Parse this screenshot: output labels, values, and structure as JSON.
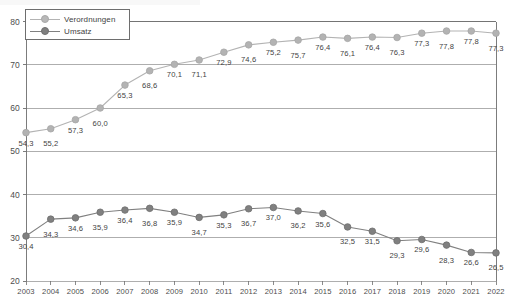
{
  "chart_data": {
    "type": "line",
    "title": "",
    "xlabel": "",
    "ylabel": "",
    "categories": [
      "2003",
      "2004",
      "2005",
      "2006",
      "2007",
      "2008",
      "2009",
      "2010",
      "2011",
      "2012",
      "2013",
      "2014",
      "2015",
      "2016",
      "2017",
      "2018",
      "2019",
      "2020",
      "2021",
      "2022"
    ],
    "ylim": [
      20,
      80
    ],
    "yticks": [
      20,
      30,
      40,
      50,
      60,
      70,
      80
    ],
    "grid": true,
    "legend_position": "top-left",
    "series": [
      {
        "name": "Verordnungen",
        "color": "#b3b3b3",
        "values": [
          54.3,
          55.2,
          57.3,
          60.0,
          65.3,
          68.6,
          70.1,
          71.1,
          72.9,
          74.6,
          75.2,
          75.7,
          76.4,
          76.1,
          76.4,
          76.3,
          77.3,
          77.8,
          77.8,
          77.3
        ],
        "labels": [
          "54,3",
          "55,2",
          "57,3",
          "60,0",
          "65,3",
          "68,6",
          "70,1",
          "71,1",
          "72,9",
          "74,6",
          "75,2",
          "75,7",
          "76,4",
          "76,1",
          "76,4",
          "76,3",
          "77,3",
          "77,8",
          "77,8",
          "77,3"
        ]
      },
      {
        "name": "Umsatz",
        "color": "#808080",
        "values": [
          30.4,
          34.3,
          34.6,
          35.9,
          36.4,
          36.8,
          35.9,
          34.7,
          35.3,
          36.7,
          37.0,
          36.2,
          35.6,
          32.5,
          31.5,
          29.3,
          29.6,
          28.3,
          26.6,
          26.5
        ],
        "labels": [
          "30,4",
          "34,3",
          "34,6",
          "35,9",
          "36,4",
          "36,8",
          "35,9",
          "34,7",
          "35,3",
          "36,7",
          "37,0",
          "36,2",
          "35,6",
          "32,5",
          "31,5",
          "29,3",
          "29,6",
          "28,3",
          "26,6",
          "26,5"
        ]
      }
    ]
  },
  "legend": {
    "items": [
      {
        "label": "Verordnungen"
      },
      {
        "label": "Umsatz"
      }
    ]
  },
  "axis": {
    "ytick_labels": [
      "80",
      "70",
      "60",
      "50",
      "40",
      "30",
      "20"
    ]
  }
}
